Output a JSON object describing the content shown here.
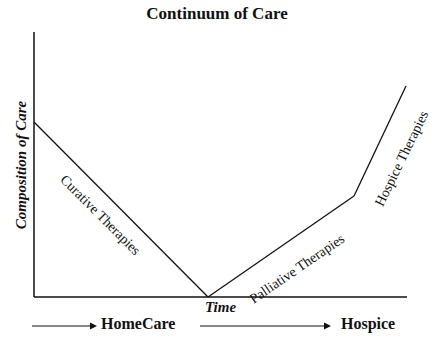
{
  "title": "Continuum of Care",
  "axes": {
    "ylabel": "Composition of Care",
    "xlabel": "Time"
  },
  "curves": [
    {
      "label": "Curative Therapies",
      "from": [
        34,
        122
      ],
      "to": [
        208,
        297
      ]
    },
    {
      "label": "Palliative Therapies",
      "from": [
        208,
        297
      ],
      "to": [
        354,
        196
      ]
    },
    {
      "label": "Hospice Therapies",
      "from": [
        354,
        196
      ],
      "to": [
        406,
        86
      ]
    }
  ],
  "stages": [
    {
      "label": "HomeCare"
    },
    {
      "label": "Hospice"
    }
  ],
  "colors": {
    "line": "#111111",
    "background": "#ffffff"
  }
}
